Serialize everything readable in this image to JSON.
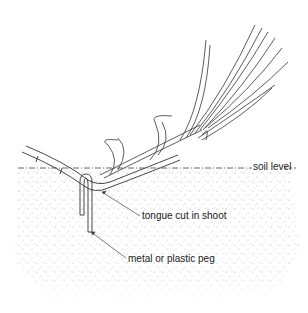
{
  "diagram": {
    "labels": {
      "soil_level": "soil level",
      "tongue_cut": "tongue cut in shoot",
      "peg": "metal or plastic peg"
    },
    "colors": {
      "line": "#333333",
      "soil_speckle": "#9a9a9a",
      "background": "#ffffff"
    }
  }
}
